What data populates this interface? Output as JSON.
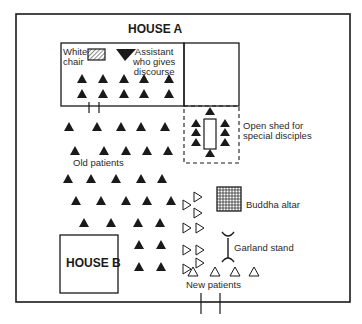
{
  "diagram": {
    "type": "floor-plan",
    "colors": {
      "ink": "#1a1a1a",
      "label": "#2a2a2a",
      "background": "#ffffff"
    },
    "buildings": {
      "house_a": {
        "label": "HOUSE A"
      },
      "house_b": {
        "label": "HOUSE B"
      }
    },
    "labels": {
      "white_chair": [
        "White",
        "chair"
      ],
      "assistant": [
        "Assistant",
        "who gives",
        "discourse"
      ],
      "open_shed": [
        "Open shed for",
        "special disciples"
      ],
      "old_patients": "Old patients",
      "buddha_altar": "Buddha altar",
      "garland_stand": "Garland stand",
      "new_patients": "New patients"
    },
    "legend_symbols": {
      "old_patient": "filled-triangle",
      "new_patient": "outline-triangle",
      "assistant": "filled-inverted-triangle",
      "white_chair": "hatched-rectangle",
      "buddha_altar": "grid-square",
      "garland_stand": "stand-glyph"
    },
    "counts": {
      "old_patients_in_house_a": 10,
      "special_disciples_in_shed": 8,
      "old_patients_in_yard": 26,
      "new_patients": 13
    }
  }
}
